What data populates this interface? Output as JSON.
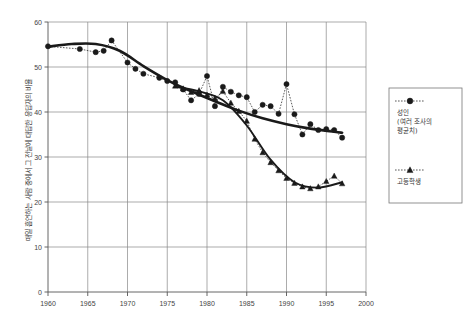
{
  "chart_data": {
    "type": "line",
    "title": "",
    "xlabel": "",
    "ylabel": "매일 흡연하는 사람 중에서 그 전날에 대답한 응답자의 비율",
    "xlim": [
      1960,
      2000
    ],
    "ylim": [
      0,
      60
    ],
    "xticks": [
      "1960",
      "1965",
      "1970",
      "1975",
      "1980",
      "1985",
      "1990",
      "1995",
      "2000"
    ],
    "yticks": [
      "0",
      "10",
      "20",
      "30",
      "40",
      "50",
      "60"
    ],
    "grid": true,
    "legend_position": "right",
    "series": [
      {
        "name": "성인\n(여러 조사의\n평균치)",
        "name_line1": "성인",
        "name_line2": "(여러 조사의",
        "name_line3": "평균치)",
        "marker": "circle",
        "line_style": "dotted",
        "x": [
          1960,
          1964,
          1966,
          1967,
          1968,
          1970,
          1971,
          1972,
          1974,
          1975,
          1976,
          1977,
          1978,
          1979,
          1980,
          1981,
          1982,
          1983,
          1984,
          1985,
          1986,
          1987,
          1988,
          1989,
          1990,
          1991,
          1992,
          1993,
          1994,
          1995,
          1996,
          1997
        ],
        "values": [
          54.6,
          54.0,
          53.3,
          53.6,
          55.9,
          51.0,
          49.6,
          48.5,
          47.6,
          46.9,
          46.6,
          45.0,
          42.6,
          44.0,
          48.0,
          41.3,
          45.6,
          44.5,
          43.7,
          43.3,
          40.0,
          41.6,
          41.3,
          39.6,
          46.2,
          39.5,
          35.0,
          37.3,
          36.0,
          36.2,
          36.0,
          34.3
        ],
        "trend_x": [
          1960,
          1963,
          1966,
          1969,
          1972,
          1975,
          1978,
          1981,
          1984,
          1987,
          1990,
          1993,
          1996,
          1997
        ],
        "trend_values": [
          54.5,
          55.1,
          55.1,
          53.6,
          50.2,
          47.1,
          44.6,
          42.4,
          40.3,
          38.6,
          37.3,
          36.3,
          35.6,
          35.4
        ]
      },
      {
        "name": "고등학생",
        "marker": "triangle",
        "line_style": "dotted",
        "x": [
          1976,
          1977,
          1978,
          1979,
          1980,
          1981,
          1982,
          1983,
          1984,
          1985,
          1986,
          1987,
          1988,
          1989,
          1990,
          1991,
          1992,
          1993,
          1994,
          1995,
          1996,
          1997
        ],
        "values": [
          45.8,
          45.2,
          44.4,
          44.8,
          43.8,
          43.0,
          44.6,
          42.0,
          40.2,
          38.0,
          34.0,
          31.0,
          28.8,
          27.0,
          25.3,
          24.2,
          23.4,
          23.0,
          23.4,
          24.6,
          25.8,
          24.1
        ],
        "trend_x": [
          1976,
          1979,
          1982,
          1985,
          1988,
          1991,
          1994,
          1997
        ],
        "trend_values": [
          45.6,
          44.6,
          42.6,
          37.0,
          29.4,
          24.4,
          23.2,
          24.4
        ]
      }
    ]
  },
  "legend": {
    "entries": [
      {
        "label_line1": "성인",
        "label_line2": "(여러 조사의",
        "label_line3": "평균치)",
        "marker": "circle-marker"
      },
      {
        "label_line1": "고등학생",
        "label_line2": "",
        "label_line3": "",
        "marker": "triangle-marker"
      }
    ]
  },
  "axis": {
    "y_title": "매일 흡연하는 사람 중에서 그 전날에 대답한 응답자의 비율",
    "y_labels": [
      "60",
      "50",
      "40",
      "30",
      "20",
      "10",
      "0"
    ],
    "x_labels": [
      "1960",
      "1965",
      "1970",
      "1975",
      "1980",
      "1985",
      "1990",
      "1995",
      "2000"
    ]
  },
  "colors": {
    "ink": "#1a1a1a",
    "grid": "#888888",
    "frame": "#777777",
    "background": "#ffffff"
  }
}
